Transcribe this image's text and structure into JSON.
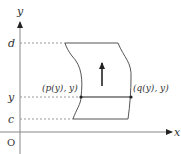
{
  "diagram": {
    "axes": {
      "x_label": "x",
      "y_label": "y",
      "origin_label": "O"
    },
    "levels": {
      "top": "d",
      "middle": "y",
      "bottom": "c"
    },
    "points": {
      "left": "(p(y), y)",
      "right": "(q(y), y)"
    },
    "colors": {
      "stroke": "#333333",
      "axis": "#888888",
      "dashed": "#999999"
    }
  }
}
